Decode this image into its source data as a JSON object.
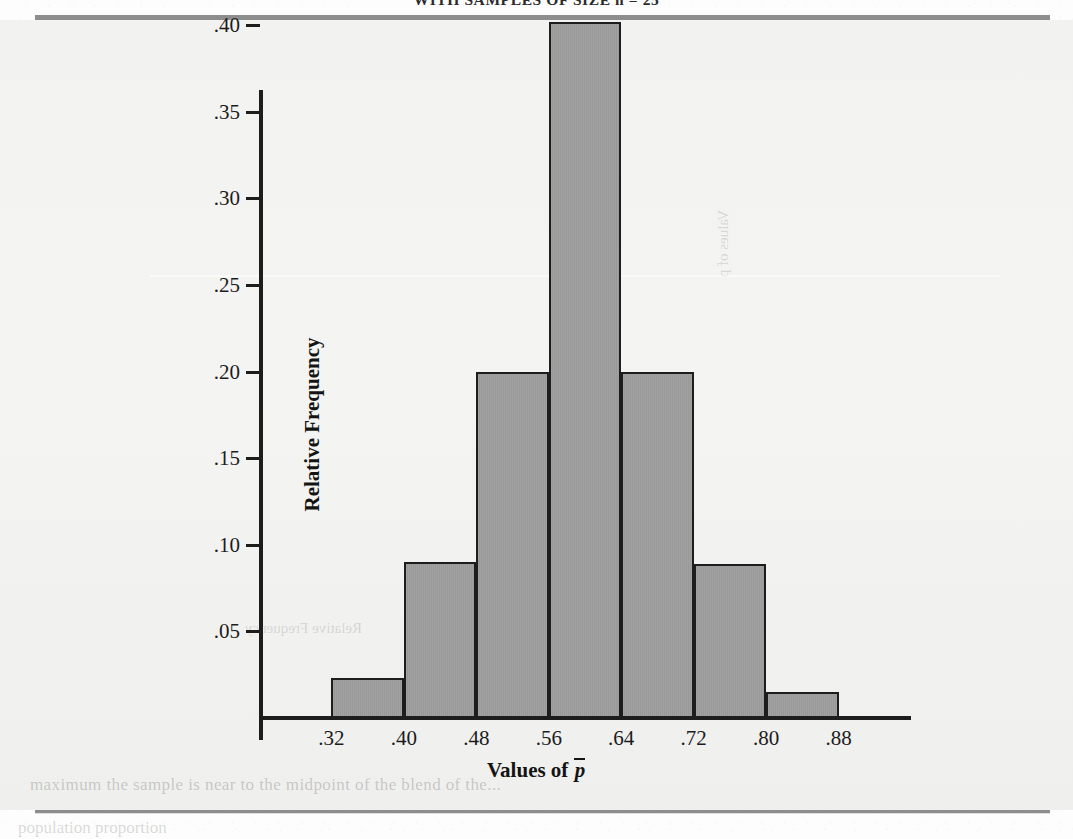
{
  "page": {
    "running_head": "WITH SAMPLES OF SIZE n = 25",
    "bleed_text_left": "Relative Frequency",
    "bleed_text_right": "Values of p",
    "caption_text": "maximum the sample is near to the midpoint of the blend of the...",
    "footer_text": "population proportion"
  },
  "chart_data": {
    "type": "bar",
    "title": "",
    "xlabel": "Values of p̄",
    "ylabel": "Relative Frequency",
    "xlabel_parts": {
      "prefix": "Values of ",
      "symbol": "p"
    },
    "categories": [
      ".32-.40",
      ".40-.48",
      ".48-.56",
      ".56-.64",
      ".64-.72",
      ".72-.80",
      ".80-.88"
    ],
    "bin_edges": [
      0.32,
      0.4,
      0.48,
      0.56,
      0.64,
      0.72,
      0.8,
      0.88
    ],
    "values": [
      0.023,
      0.09,
      0.2,
      0.402,
      0.2,
      0.089,
      0.015
    ],
    "xtick_labels": [
      ".32",
      ".40",
      ".48",
      ".56",
      ".64",
      ".72",
      ".80",
      ".88"
    ],
    "ytick_labels": [
      ".05",
      ".10",
      ".15",
      ".20",
      ".25",
      ".30",
      ".35",
      ".40"
    ],
    "ytick_values": [
      0.05,
      0.1,
      0.15,
      0.2,
      0.25,
      0.3,
      0.35,
      0.4
    ],
    "xlim": [
      0.24,
      0.96
    ],
    "ylim": [
      0.0,
      0.43
    ],
    "grid": false,
    "legend": false,
    "bar_fill_color": "#9c9c9c",
    "bar_edge_color": "#1d1d1d",
    "axis_color": "#1d1d1d",
    "background_color": "#f2f2f0",
    "rule_color": "#8d8d8d"
  }
}
